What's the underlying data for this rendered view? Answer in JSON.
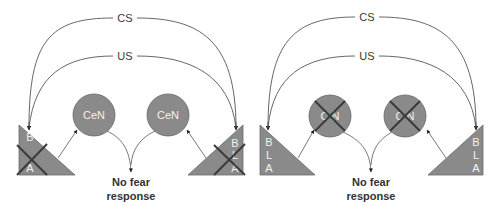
{
  "colors": {
    "shape_fill": "#8a8a8a",
    "shape_stroke": "#5a5a5a",
    "cross": "#3a3a3a",
    "line": "#555555",
    "label_text": "#f2f2f2",
    "caption_text": "#333333"
  },
  "panels": [
    {
      "name": "left-panel",
      "arcs": {
        "outer_label": "CS",
        "inner_label": "US"
      },
      "left_triangle": {
        "labels": [
          "B",
          "",
          "A"
        ],
        "crossed": true
      },
      "right_triangle": {
        "labels": [
          "B",
          "L",
          "A"
        ],
        "crossed": true
      },
      "nodes": [
        {
          "label": "CeN",
          "crossed": false
        },
        {
          "label": "CeN",
          "crossed": false
        }
      ],
      "output": {
        "line1": "No fear",
        "line2": "response"
      }
    },
    {
      "name": "right-panel",
      "arcs": {
        "outer_label": "CS",
        "inner_label": "US"
      },
      "left_triangle": {
        "labels": [
          "B",
          "L",
          "A"
        ],
        "crossed": false
      },
      "right_triangle": {
        "labels": [
          "B",
          "L",
          "A"
        ],
        "crossed": false
      },
      "nodes": [
        {
          "label": "C N",
          "crossed": true
        },
        {
          "label": "C N",
          "crossed": true
        }
      ],
      "output": {
        "line1": "No fear",
        "line2": "response"
      }
    }
  ]
}
